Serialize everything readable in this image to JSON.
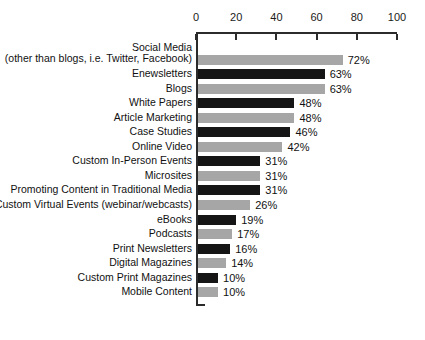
{
  "chart_data": {
    "type": "bar",
    "orientation": "horizontal",
    "title": "",
    "xlabel": "",
    "ylabel": "",
    "xlim": [
      0,
      100
    ],
    "xticks": [
      0,
      20,
      40,
      60,
      80,
      100
    ],
    "xtick_labels": [
      "0",
      "20",
      "40",
      "60",
      "80",
      "100"
    ],
    "grid": false,
    "legend": "none",
    "value_suffix": "%",
    "colors": {
      "gray": "#a6a6a6",
      "black": "#151515",
      "axis": "#2b2b2b",
      "text": "#111111",
      "background": "#ffffff"
    },
    "categories": [
      "Social Media\n(other than blogs, i.e. Twitter, Facebook)",
      "Enewsletters",
      "Blogs",
      "White Papers",
      "Article Marketing",
      "Case Studies",
      "Online Video",
      "Custom In-Person Events",
      "Microsites",
      "Promoting Content in Traditional Media",
      "Custom Virtual Events (webinar/webcasts)",
      "eBooks",
      "Podcasts",
      "Print Newsletters",
      "Digital Magazines",
      "Custom Print Magazines",
      "Mobile Content"
    ],
    "values": [
      72,
      63,
      63,
      48,
      48,
      46,
      42,
      31,
      31,
      31,
      26,
      19,
      17,
      16,
      14,
      10,
      10
    ],
    "value_labels": [
      "72%",
      "63%",
      "63%",
      "48%",
      "48%",
      "46%",
      "42%",
      "31%",
      "31%",
      "31%",
      "26%",
      "19%",
      "17%",
      "16%",
      "14%",
      "10%",
      "10%"
    ],
    "bar_colors": [
      "gray",
      "black",
      "gray",
      "black",
      "gray",
      "black",
      "gray",
      "black",
      "gray",
      "black",
      "gray",
      "black",
      "gray",
      "black",
      "gray",
      "black",
      "gray"
    ],
    "rows": [
      {
        "label_line1": "Social Media",
        "label_line2": "(other than blogs, i.e. Twitter, Facebook)",
        "value": 72,
        "value_label": "72%",
        "color": "gray"
      },
      {
        "label_line1": "Enewsletters",
        "label_line2": "",
        "value": 63,
        "value_label": "63%",
        "color": "black"
      },
      {
        "label_line1": "Blogs",
        "label_line2": "",
        "value": 63,
        "value_label": "63%",
        "color": "gray"
      },
      {
        "label_line1": "White Papers",
        "label_line2": "",
        "value": 48,
        "value_label": "48%",
        "color": "black"
      },
      {
        "label_line1": "Article Marketing",
        "label_line2": "",
        "value": 48,
        "value_label": "48%",
        "color": "gray"
      },
      {
        "label_line1": "Case Studies",
        "label_line2": "",
        "value": 46,
        "value_label": "46%",
        "color": "black"
      },
      {
        "label_line1": "Online Video",
        "label_line2": "",
        "value": 42,
        "value_label": "42%",
        "color": "gray"
      },
      {
        "label_line1": "Custom In-Person Events",
        "label_line2": "",
        "value": 31,
        "value_label": "31%",
        "color": "black"
      },
      {
        "label_line1": "Microsites",
        "label_line2": "",
        "value": 31,
        "value_label": "31%",
        "color": "gray"
      },
      {
        "label_line1": "Promoting Content in Traditional Media",
        "label_line2": "",
        "value": 31,
        "value_label": "31%",
        "color": "black"
      },
      {
        "label_line1": "Custom Virtual Events (webinar/webcasts)",
        "label_line2": "",
        "value": 26,
        "value_label": "26%",
        "color": "gray"
      },
      {
        "label_line1": "eBooks",
        "label_line2": "",
        "value": 19,
        "value_label": "19%",
        "color": "black"
      },
      {
        "label_line1": "Podcasts",
        "label_line2": "",
        "value": 17,
        "value_label": "17%",
        "color": "gray"
      },
      {
        "label_line1": "Print Newsletters",
        "label_line2": "",
        "value": 16,
        "value_label": "16%",
        "color": "black"
      },
      {
        "label_line1": "Digital Magazines",
        "label_line2": "",
        "value": 14,
        "value_label": "14%",
        "color": "gray"
      },
      {
        "label_line1": "Custom Print Magazines",
        "label_line2": "",
        "value": 10,
        "value_label": "10%",
        "color": "black"
      },
      {
        "label_line1": "Mobile Content",
        "label_line2": "",
        "value": 10,
        "value_label": "10%",
        "color": "gray"
      }
    ]
  }
}
